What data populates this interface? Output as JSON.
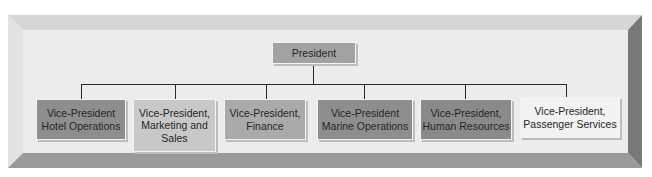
{
  "chart": {
    "root": {
      "label": "President",
      "color": "#a2a2a2"
    },
    "children": [
      {
        "label": "Vice-President Hotel Operations",
        "color": "#8e8e8e"
      },
      {
        "label": "Vice-President, Marketing and Sales",
        "color": "#c8c8c8"
      },
      {
        "label": "Vice-President, Finance",
        "color": "#aaaaaa"
      },
      {
        "label": "Vice-President Marine Operations",
        "color": "#8e8e8e"
      },
      {
        "label": "Vice-President, Human Resources",
        "color": "#8a8a8a"
      },
      {
        "label": "Vice-President, Passenger Services",
        "color": "#f2f2f2"
      }
    ]
  },
  "frame_colors": {
    "top": "#d6d6d6",
    "left": "#e2e2e2",
    "right": "#787878",
    "bottom": "#9a9a9a",
    "face": "#ececec"
  }
}
